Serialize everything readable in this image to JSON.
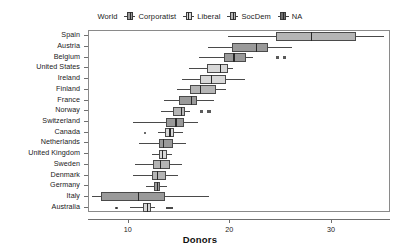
{
  "legend": {
    "title": "World",
    "entries": [
      {
        "label": "Corporatist",
        "icon": "boxplot-icon",
        "fill": "#9a9a9a"
      },
      {
        "label": "Liberal",
        "icon": "boxplot-icon",
        "fill": "#d8d8d8"
      },
      {
        "label": "SocDem",
        "icon": "boxplot-icon",
        "fill": "#b5b5b5"
      },
      {
        "label": "NA",
        "icon": "boxplot-icon",
        "fill": "#6e6e6e"
      }
    ]
  },
  "axes": {
    "xlabel": "Donors",
    "xticks": [
      10,
      20,
      30
    ],
    "xtick_labels": [
      "10",
      "20",
      "30"
    ],
    "xlim": [
      6.1,
      35.8
    ],
    "grid": false
  },
  "chart_data": {
    "type": "box",
    "title": "",
    "subtitle": "",
    "xlabel": "Donors",
    "ylabel": "",
    "xlim": [
      6.1,
      35.8
    ],
    "grid": false,
    "legend_position": "top-center",
    "legend_title": "World",
    "categories": [
      "Spain",
      "Austria",
      "Belgium",
      "United States",
      "Ireland",
      "Finland",
      "France",
      "Norway",
      "Switzerland",
      "Canada",
      "Netherlands",
      "United Kingdom",
      "Sweden",
      "Denmark",
      "Germany",
      "Italy",
      "Australia"
    ],
    "boxes": [
      {
        "country": "Spain",
        "group": "SocDem",
        "whisker_low": 19.8,
        "q1": 24.5,
        "median": 27.9,
        "q3": 32.4,
        "whisker_high": 35.1,
        "outliers": [],
        "na_marks": []
      },
      {
        "country": "Austria",
        "group": "Corporatist",
        "whisker_low": 17.8,
        "q1": 20.2,
        "median": 22.5,
        "q3": 23.7,
        "whisker_high": 26.1,
        "outliers": [],
        "na_marks": []
      },
      {
        "country": "Belgium",
        "group": "Corporatist",
        "whisker_low": 16.9,
        "q1": 19.4,
        "median": 20.3,
        "q3": 21.5,
        "whisker_high": 22.2,
        "outliers": [],
        "na_marks": [
          24.6,
          25.3
        ]
      },
      {
        "country": "United States",
        "group": "Liberal",
        "whisker_low": 15.9,
        "q1": 17.7,
        "median": 19.0,
        "q3": 19.8,
        "whisker_high": 20.3,
        "outliers": [],
        "na_marks": []
      },
      {
        "country": "Ireland",
        "group": "Liberal",
        "whisker_low": 15.2,
        "q1": 17.0,
        "median": 18.1,
        "q3": 19.6,
        "whisker_high": 21.4,
        "outliers": [],
        "na_marks": []
      },
      {
        "country": "Finland",
        "group": "SocDem",
        "whisker_low": 14.8,
        "q1": 16.0,
        "median": 17.0,
        "q3": 18.6,
        "whisker_high": 19.6,
        "outliers": [],
        "na_marks": []
      },
      {
        "country": "France",
        "group": "Corporatist",
        "whisker_low": 13.5,
        "q1": 15.0,
        "median": 16.1,
        "q3": 16.7,
        "whisker_high": 18.4,
        "outliers": [],
        "na_marks": []
      },
      {
        "country": "Norway",
        "group": "SocDem",
        "whisker_low": 13.2,
        "q1": 14.4,
        "median": 15.1,
        "q3": 15.5,
        "whisker_high": 16.0,
        "outliers": [],
        "na_marks": [
          17.2,
          17.9
        ]
      },
      {
        "country": "Switzerland",
        "group": "Corporatist",
        "whisker_low": 10.4,
        "q1": 13.7,
        "median": 14.6,
        "q3": 15.4,
        "whisker_high": 16.8,
        "outliers": [],
        "na_marks": []
      },
      {
        "country": "Canada",
        "group": "Liberal",
        "whisker_low": 12.9,
        "q1": 13.6,
        "median": 14.0,
        "q3": 14.5,
        "whisker_high": 15.3,
        "outliers": [
          11.6
        ],
        "na_marks": []
      },
      {
        "country": "Netherlands",
        "group": "Corporatist",
        "whisker_low": 11.0,
        "q1": 13.0,
        "median": 13.4,
        "q3": 14.4,
        "whisker_high": 15.6,
        "outliers": [],
        "na_marks": []
      },
      {
        "country": "United Kingdom",
        "group": "Liberal",
        "whisker_low": 12.3,
        "q1": 13.0,
        "median": 13.3,
        "q3": 13.8,
        "whisker_high": 14.3,
        "outliers": [],
        "na_marks": []
      },
      {
        "country": "Sweden",
        "group": "SocDem",
        "whisker_low": 10.6,
        "q1": 12.4,
        "median": 13.1,
        "q3": 14.1,
        "whisker_high": 15.2,
        "outliers": [],
        "na_marks": []
      },
      {
        "country": "Denmark",
        "group": "SocDem",
        "whisker_low": 10.4,
        "q1": 12.3,
        "median": 12.8,
        "q3": 13.7,
        "whisker_high": 14.9,
        "outliers": [],
        "na_marks": []
      },
      {
        "country": "Germany",
        "group": "Corporatist",
        "whisker_low": 11.7,
        "q1": 12.5,
        "median": 12.8,
        "q3": 13.1,
        "whisker_high": 13.8,
        "outliers": [],
        "na_marks": []
      },
      {
        "country": "Italy",
        "group": "Corporatist",
        "whisker_low": 6.4,
        "q1": 7.3,
        "median": 10.9,
        "q3": 13.6,
        "whisker_high": 17.9,
        "outliers": [],
        "na_marks": []
      },
      {
        "country": "Australia",
        "group": "Liberal",
        "whisker_low": 10.1,
        "q1": 11.4,
        "median": 11.8,
        "q3": 12.2,
        "whisker_high": 12.6,
        "outliers": [
          8.8
        ],
        "na_marks": [
          13.8
        ]
      }
    ]
  }
}
